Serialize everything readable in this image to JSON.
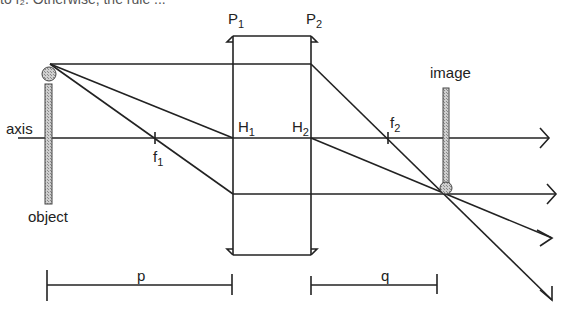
{
  "header_fragment": "to f₂. Otherwise, the rule ...",
  "labels": {
    "axis": "axis",
    "object": "object",
    "image": "image",
    "p1": "P",
    "p1_sub": "1",
    "p2": "P",
    "p2_sub": "2",
    "h1": "H",
    "h1_sub": "1",
    "h2": "H",
    "h2_sub": "2",
    "f1": "f",
    "f1_sub": "1",
    "f2": "f",
    "f2_sub": "2",
    "p": "p",
    "q": "q"
  },
  "colors": {
    "line": "#222222",
    "object_fill": "#b5b5b5"
  }
}
